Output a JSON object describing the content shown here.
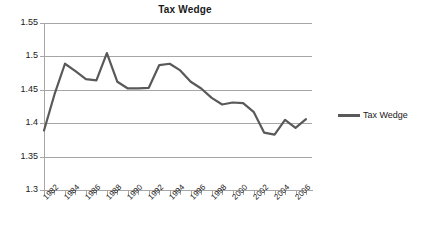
{
  "chart_data": {
    "type": "line",
    "title": "Tax Wedge",
    "xlabel": "",
    "ylabel": "",
    "ylim": [
      1.3,
      1.55
    ],
    "ytick_labels": [
      "1.55",
      "1.5",
      "1.45",
      "1.4",
      "1.35",
      "1.3"
    ],
    "ytick_values": [
      1.55,
      1.5,
      1.45,
      1.4,
      1.35,
      1.3
    ],
    "grid": true,
    "legend_position": "right",
    "legend": [
      "Tax Wedge"
    ],
    "x": [
      1982,
      1983,
      1984,
      1985,
      1986,
      1987,
      1988,
      1989,
      1990,
      1991,
      1992,
      1993,
      1994,
      1995,
      1996,
      1997,
      1998,
      1999,
      2000,
      2001,
      2002,
      2003,
      2004,
      2005,
      2006,
      2007
    ],
    "xtick_labels": [
      "1982",
      "1984",
      "1986",
      "1988",
      "1990",
      "1992",
      "1994",
      "1996",
      "1998",
      "2000",
      "2002",
      "2004",
      "2006"
    ],
    "xtick_values": [
      1982,
      1984,
      1986,
      1988,
      1990,
      1992,
      1994,
      1996,
      1998,
      2000,
      2002,
      2004,
      2006
    ],
    "series": [
      {
        "name": "Tax Wedge",
        "color": "#595959",
        "values": [
          1.389,
          1.443,
          1.489,
          1.478,
          1.466,
          1.464,
          1.505,
          1.462,
          1.452,
          1.452,
          1.453,
          1.487,
          1.489,
          1.479,
          1.462,
          1.452,
          1.438,
          1.428,
          1.431,
          1.43,
          1.417,
          1.386,
          1.383,
          1.405,
          1.393,
          1.406
        ]
      }
    ]
  },
  "colors": {
    "line": "#595959",
    "gridline": "#a6a6a6",
    "axis": "#a6a6a6",
    "text": "#1a1a1a",
    "background": "#ffffff"
  }
}
